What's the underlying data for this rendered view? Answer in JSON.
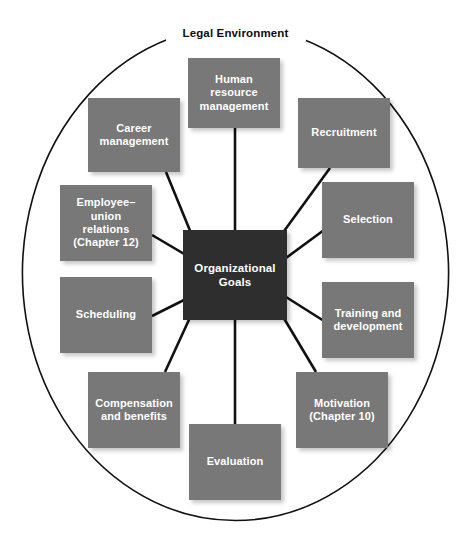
{
  "diagram": {
    "boundary_label": "Legal Environment",
    "boundary_shape": "ellipse",
    "center": {
      "label": "Organizational\nGoals",
      "color": "#2e2e2e",
      "text_color": "#ffffff"
    },
    "node_color": "#787878",
    "node_text_color": "#ffffff",
    "connector_color": "#111111",
    "nodes": [
      {
        "id": "human-resource-management",
        "label": "Human\nresource\nmanagement"
      },
      {
        "id": "recruitment",
        "label": "Recruitment"
      },
      {
        "id": "selection",
        "label": "Selection"
      },
      {
        "id": "training-and-development",
        "label": "Training and\ndevelopment"
      },
      {
        "id": "motivation",
        "label": "Motivation\n(Chapter 10)"
      },
      {
        "id": "evaluation",
        "label": "Evaluation"
      },
      {
        "id": "compensation-and-benefits",
        "label": "Compensation\nand benefits"
      },
      {
        "id": "scheduling",
        "label": "Scheduling"
      },
      {
        "id": "employee-union-relations",
        "label": "Employee–\nunion\nrelations\n(Chapter 12)"
      },
      {
        "id": "career-management",
        "label": "Career\nmanagement"
      }
    ]
  }
}
